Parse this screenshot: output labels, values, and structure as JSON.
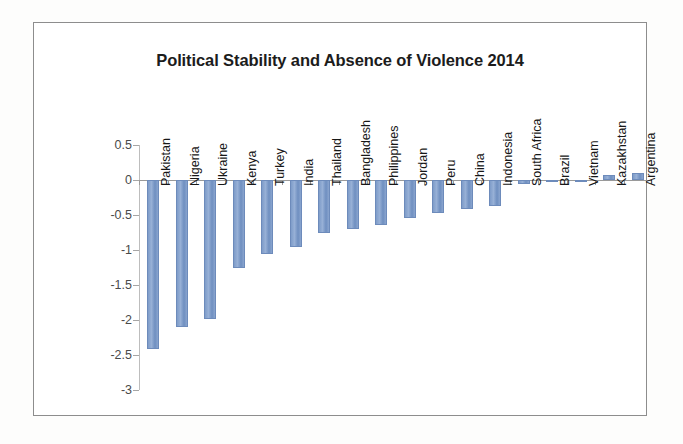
{
  "page": {
    "background": "#ffffff",
    "frame_border_color": "#8d8d8d"
  },
  "chart_data": {
    "type": "bar",
    "title": "Political Stability and Absence of Violence 2014",
    "xlabel": "",
    "ylabel": "",
    "ylim": [
      -3,
      0.5
    ],
    "yticks": [
      "0.5",
      "0",
      "-0.5",
      "-1",
      "-1.5",
      "-2",
      "-2.5",
      "-3"
    ],
    "ytick_values": [
      0.5,
      0,
      -0.5,
      -1,
      -1.5,
      -2,
      -2.5,
      -3
    ],
    "grid": false,
    "legend": "none",
    "bar_color": "#7e9cc9",
    "categories": [
      "Pakistan",
      "Nigeria",
      "Ukraine",
      "Kenya",
      "Turkey",
      "India",
      "Thailand",
      "Bangladesh",
      "Philippines",
      "Jordan",
      "Peru",
      "China",
      "Indonesia",
      "South Africa",
      "Brazil",
      "Vietnam",
      "Kazakhstan",
      "Argentina"
    ],
    "values": [
      -2.42,
      -2.1,
      -1.98,
      -1.25,
      -1.05,
      -0.95,
      -0.76,
      -0.7,
      -0.64,
      -0.54,
      -0.47,
      -0.42,
      -0.37,
      -0.06,
      -0.03,
      0.0,
      0.07,
      0.1
    ]
  }
}
